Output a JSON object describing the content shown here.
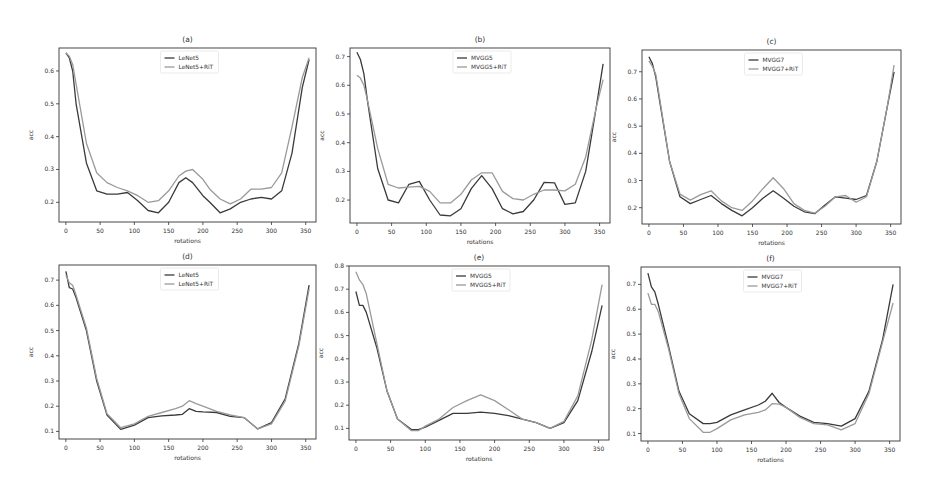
{
  "figure": {
    "panels": [
      {
        "id": "a",
        "title": "(a)",
        "xlabel": "rotations",
        "ylabel": "acc",
        "legend": [
          "LeNet5",
          "LeNet5+RiT"
        ]
      },
      {
        "id": "b",
        "title": "(b)",
        "xlabel": "rotations",
        "ylabel": "acc",
        "legend": [
          "MVGG5",
          "MVGG5+RiT"
        ]
      },
      {
        "id": "c",
        "title": "(c)",
        "xlabel": "rotations",
        "ylabel": "acc",
        "legend": [
          "MVGG7",
          "MVGG7+RiT"
        ]
      },
      {
        "id": "d",
        "title": "(d)",
        "xlabel": "rotations",
        "ylabel": "acc",
        "legend": [
          "LeNet5",
          "LeNet5+RiT"
        ]
      },
      {
        "id": "e",
        "title": "(e)",
        "xlabel": "rotations",
        "ylabel": "acc",
        "legend": [
          "MVGG5",
          "MVGG5+RiT"
        ]
      },
      {
        "id": "f",
        "title": "(f)",
        "xlabel": "rotations",
        "ylabel": "acc",
        "legend": [
          "MVGG7",
          "MVGG7+RiT"
        ]
      }
    ],
    "colors": {
      "base": "#3a3a3a",
      "rit": "#9a9a9a",
      "axis": "#333333"
    }
  },
  "chart_data": [
    {
      "type": "line",
      "title": "(a)",
      "xlabel": "rotations",
      "ylabel": "acc",
      "xlim": [
        -10,
        365
      ],
      "ylim": [
        0.14,
        0.67
      ],
      "xticks": [
        0,
        50,
        100,
        150,
        200,
        250,
        300,
        350
      ],
      "yticks": [
        0.2,
        0.3,
        0.4,
        0.5,
        0.6
      ],
      "legend_position": "upper center",
      "grid": false,
      "x": [
        0,
        5,
        10,
        15,
        30,
        45,
        60,
        75,
        90,
        105,
        120,
        135,
        150,
        165,
        175,
        185,
        200,
        210,
        225,
        240,
        255,
        270,
        285,
        300,
        315,
        330,
        345,
        355
      ],
      "series": [
        {
          "name": "LeNet5",
          "values": [
            0.655,
            0.64,
            0.6,
            0.5,
            0.32,
            0.235,
            0.225,
            0.225,
            0.23,
            0.205,
            0.175,
            0.168,
            0.2,
            0.26,
            0.275,
            0.26,
            0.22,
            0.2,
            0.168,
            0.18,
            0.2,
            0.21,
            0.215,
            0.21,
            0.235,
            0.35,
            0.55,
            0.635
          ]
        },
        {
          "name": "LeNet5+RiT",
          "values": [
            0.655,
            0.645,
            0.62,
            0.56,
            0.38,
            0.29,
            0.26,
            0.245,
            0.235,
            0.22,
            0.2,
            0.205,
            0.235,
            0.28,
            0.295,
            0.3,
            0.27,
            0.24,
            0.21,
            0.195,
            0.21,
            0.24,
            0.24,
            0.245,
            0.29,
            0.43,
            0.58,
            0.64
          ]
        }
      ]
    },
    {
      "type": "line",
      "title": "(b)",
      "xlabel": "rotations",
      "ylabel": "acc",
      "xlim": [
        -10,
        365
      ],
      "ylim": [
        0.12,
        0.73
      ],
      "xticks": [
        0,
        50,
        100,
        150,
        200,
        250,
        300,
        350
      ],
      "yticks": [
        0.2,
        0.3,
        0.4,
        0.5,
        0.6,
        0.7
      ],
      "legend_position": "upper center",
      "grid": false,
      "x": [
        0,
        5,
        10,
        15,
        30,
        45,
        60,
        75,
        90,
        105,
        120,
        135,
        150,
        165,
        180,
        195,
        210,
        225,
        240,
        255,
        270,
        285,
        300,
        315,
        330,
        345,
        355
      ],
      "series": [
        {
          "name": "MVGG5",
          "values": [
            0.715,
            0.69,
            0.64,
            0.55,
            0.31,
            0.2,
            0.19,
            0.255,
            0.265,
            0.2,
            0.148,
            0.145,
            0.17,
            0.24,
            0.285,
            0.24,
            0.17,
            0.152,
            0.16,
            0.2,
            0.262,
            0.26,
            0.185,
            0.19,
            0.3,
            0.52,
            0.675
          ]
        },
        {
          "name": "MVGG5+RiT",
          "values": [
            0.635,
            0.625,
            0.6,
            0.55,
            0.38,
            0.255,
            0.242,
            0.245,
            0.248,
            0.23,
            0.19,
            0.19,
            0.22,
            0.27,
            0.295,
            0.295,
            0.23,
            0.205,
            0.2,
            0.22,
            0.235,
            0.235,
            0.232,
            0.255,
            0.35,
            0.52,
            0.62
          ]
        }
      ]
    },
    {
      "type": "line",
      "title": "(c)",
      "xlabel": "rotations",
      "ylabel": "acc",
      "xlim": [
        -10,
        365
      ],
      "ylim": [
        0.14,
        0.78
      ],
      "xticks": [
        0,
        50,
        100,
        150,
        200,
        250,
        300,
        350
      ],
      "yticks": [
        0.2,
        0.3,
        0.4,
        0.5,
        0.6,
        0.7
      ],
      "legend_position": "upper center",
      "grid": false,
      "x": [
        0,
        5,
        10,
        15,
        30,
        45,
        60,
        75,
        90,
        105,
        120,
        135,
        150,
        165,
        180,
        195,
        210,
        225,
        240,
        255,
        270,
        285,
        300,
        315,
        330,
        345,
        355
      ],
      "series": [
        {
          "name": "MVGG7",
          "values": [
            0.755,
            0.73,
            0.68,
            0.6,
            0.37,
            0.24,
            0.215,
            0.23,
            0.245,
            0.215,
            0.19,
            0.17,
            0.2,
            0.235,
            0.262,
            0.235,
            0.205,
            0.185,
            0.178,
            0.21,
            0.24,
            0.235,
            0.23,
            0.245,
            0.37,
            0.57,
            0.7
          ]
        },
        {
          "name": "MVGG7+RiT",
          "values": [
            0.74,
            0.72,
            0.69,
            0.61,
            0.37,
            0.25,
            0.228,
            0.248,
            0.262,
            0.225,
            0.2,
            0.19,
            0.225,
            0.27,
            0.31,
            0.27,
            0.215,
            0.19,
            0.18,
            0.205,
            0.24,
            0.245,
            0.22,
            0.24,
            0.37,
            0.57,
            0.725
          ]
        }
      ]
    },
    {
      "type": "line",
      "title": "(d)",
      "xlabel": "rotations",
      "ylabel": "acc",
      "xlim": [
        -10,
        365
      ],
      "ylim": [
        0.07,
        0.76
      ],
      "xticks": [
        0,
        50,
        100,
        150,
        200,
        250,
        300,
        350
      ],
      "yticks": [
        0.1,
        0.2,
        0.3,
        0.4,
        0.5,
        0.6,
        0.7
      ],
      "legend_position": "upper center",
      "grid": false,
      "x": [
        0,
        5,
        10,
        15,
        30,
        45,
        60,
        80,
        100,
        120,
        140,
        160,
        170,
        180,
        190,
        200,
        220,
        240,
        260,
        280,
        300,
        320,
        340,
        355
      ],
      "series": [
        {
          "name": "LeNet5",
          "values": [
            0.735,
            0.67,
            0.665,
            0.63,
            0.5,
            0.3,
            0.165,
            0.108,
            0.125,
            0.155,
            0.162,
            0.165,
            0.168,
            0.19,
            0.18,
            0.178,
            0.175,
            0.16,
            0.155,
            0.11,
            0.135,
            0.23,
            0.45,
            0.68
          ]
        },
        {
          "name": "LeNet5+RiT",
          "values": [
            0.72,
            0.69,
            0.68,
            0.64,
            0.51,
            0.31,
            0.17,
            0.115,
            0.13,
            0.16,
            0.175,
            0.19,
            0.2,
            0.222,
            0.21,
            0.2,
            0.18,
            0.165,
            0.155,
            0.11,
            0.13,
            0.22,
            0.44,
            0.665
          ]
        }
      ]
    },
    {
      "type": "line",
      "title": "(e)",
      "xlabel": "rotations",
      "ylabel": "acc",
      "xlim": [
        -10,
        365
      ],
      "ylim": [
        0.05,
        0.8
      ],
      "xticks": [
        0,
        50,
        100,
        150,
        200,
        250,
        300,
        350
      ],
      "yticks": [
        0.1,
        0.2,
        0.3,
        0.4,
        0.5,
        0.6,
        0.7,
        0.8
      ],
      "legend_position": "upper center",
      "grid": false,
      "x": [
        0,
        5,
        10,
        15,
        30,
        45,
        60,
        80,
        90,
        100,
        120,
        140,
        160,
        180,
        200,
        220,
        240,
        260,
        280,
        300,
        320,
        340,
        355
      ],
      "series": [
        {
          "name": "MVGG5",
          "values": [
            0.69,
            0.63,
            0.63,
            0.6,
            0.45,
            0.26,
            0.14,
            0.095,
            0.095,
            0.105,
            0.135,
            0.165,
            0.165,
            0.17,
            0.165,
            0.155,
            0.14,
            0.125,
            0.1,
            0.125,
            0.22,
            0.43,
            0.63
          ]
        },
        {
          "name": "MVGG5+RiT",
          "values": [
            0.775,
            0.74,
            0.72,
            0.68,
            0.47,
            0.26,
            0.14,
            0.09,
            0.09,
            0.11,
            0.14,
            0.19,
            0.22,
            0.245,
            0.22,
            0.18,
            0.14,
            0.125,
            0.1,
            0.13,
            0.24,
            0.48,
            0.72
          ]
        }
      ]
    },
    {
      "type": "line",
      "title": "(f)",
      "xlabel": "rotations",
      "ylabel": "acc",
      "xlim": [
        -10,
        365
      ],
      "ylim": [
        0.07,
        0.77
      ],
      "xticks": [
        0,
        50,
        100,
        150,
        200,
        250,
        300,
        350
      ],
      "yticks": [
        0.1,
        0.2,
        0.3,
        0.4,
        0.5,
        0.6,
        0.7
      ],
      "legend_position": "upper center",
      "grid": false,
      "x": [
        0,
        5,
        10,
        15,
        30,
        45,
        60,
        80,
        90,
        100,
        120,
        140,
        160,
        170,
        180,
        190,
        200,
        220,
        240,
        260,
        280,
        300,
        320,
        340,
        355
      ],
      "series": [
        {
          "name": "MVGG7",
          "values": [
            0.745,
            0.69,
            0.67,
            0.62,
            0.45,
            0.27,
            0.18,
            0.14,
            0.14,
            0.145,
            0.175,
            0.195,
            0.215,
            0.23,
            0.262,
            0.225,
            0.205,
            0.17,
            0.145,
            0.14,
            0.13,
            0.16,
            0.27,
            0.48,
            0.7
          ]
        },
        {
          "name": "MVGG7+RiT",
          "values": [
            0.665,
            0.62,
            0.62,
            0.59,
            0.44,
            0.26,
            0.16,
            0.105,
            0.105,
            0.12,
            0.155,
            0.175,
            0.185,
            0.195,
            0.22,
            0.218,
            0.205,
            0.165,
            0.14,
            0.135,
            0.115,
            0.14,
            0.26,
            0.47,
            0.625
          ]
        }
      ]
    }
  ]
}
